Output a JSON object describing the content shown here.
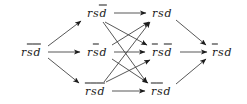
{
  "figure": {
    "type": "directed-graph",
    "background_color": "#ffffff",
    "ink_color": "#1b1b1b",
    "width": 247,
    "height": 104
  },
  "nodes": [
    {
      "id": "n0",
      "text": "rs̄d̄",
      "literals": [
        {
          "sym": "r",
          "bar": false
        },
        {
          "sym": "s",
          "bar": true
        },
        {
          "sym": "d",
          "bar": true
        }
      ],
      "x": 31,
      "y": 52,
      "column": 0,
      "row": "middle"
    },
    {
      "id": "n1",
      "text": "rsd̄",
      "literals": [
        {
          "sym": "r",
          "bar": false
        },
        {
          "sym": "s",
          "bar": false
        },
        {
          "sym": "d",
          "bar": true
        }
      ],
      "x": 97,
      "y": 13,
      "column": 1,
      "row": "top"
    },
    {
      "id": "n2",
      "text": "rs̄d",
      "literals": [
        {
          "sym": "r",
          "bar": false
        },
        {
          "sym": "s",
          "bar": true
        },
        {
          "sym": "d",
          "bar": false
        }
      ],
      "x": 97,
      "y": 52,
      "column": 1,
      "row": "middle"
    },
    {
      "id": "n3",
      "text": "r̄s̄d̄",
      "literals": [
        {
          "sym": "r",
          "bar": true
        },
        {
          "sym": "s",
          "bar": true
        },
        {
          "sym": "d",
          "bar": true
        }
      ],
      "x": 95,
      "y": 91,
      "column": 1,
      "row": "bottom"
    },
    {
      "id": "n4",
      "text": "rsd",
      "literals": [
        {
          "sym": "r",
          "bar": false
        },
        {
          "sym": "s",
          "bar": false
        },
        {
          "sym": "d",
          "bar": false
        }
      ],
      "x": 162,
      "y": 13,
      "column": 2,
      "row": "top"
    },
    {
      "id": "n5",
      "text": "r̄sd̄",
      "literals": [
        {
          "sym": "r",
          "bar": true
        },
        {
          "sym": "s",
          "bar": false
        },
        {
          "sym": "d",
          "bar": true
        }
      ],
      "x": 162,
      "y": 52,
      "column": 2,
      "row": "middle"
    },
    {
      "id": "n6",
      "text": "r̄s̄d",
      "literals": [
        {
          "sym": "r",
          "bar": true
        },
        {
          "sym": "s",
          "bar": true
        },
        {
          "sym": "d",
          "bar": false
        }
      ],
      "x": 161,
      "y": 91,
      "column": 2,
      "row": "bottom"
    },
    {
      "id": "n7",
      "text": "r̄sd",
      "literals": [
        {
          "sym": "r",
          "bar": true
        },
        {
          "sym": "s",
          "bar": false
        },
        {
          "sym": "d",
          "bar": false
        }
      ],
      "x": 222,
      "y": 52,
      "column": 3,
      "row": "middle"
    }
  ],
  "edges": [
    {
      "from": "n0",
      "to": "n1",
      "x1": 48,
      "y1": 46,
      "x2": 81,
      "y2": 21
    },
    {
      "from": "n0",
      "to": "n2",
      "x1": 48,
      "y1": 52,
      "x2": 80,
      "y2": 52
    },
    {
      "from": "n0",
      "to": "n3",
      "x1": 48,
      "y1": 58,
      "x2": 79,
      "y2": 83
    },
    {
      "from": "n1",
      "to": "n4",
      "x1": 114,
      "y1": 13,
      "x2": 146,
      "y2": 13
    },
    {
      "from": "n1",
      "to": "n5",
      "x1": 105,
      "y1": 22,
      "x2": 147,
      "y2": 45
    },
    {
      "from": "n1",
      "to": "n6",
      "x1": 103,
      "y1": 22,
      "x2": 147,
      "y2": 83
    },
    {
      "from": "n2",
      "to": "n4",
      "x1": 112,
      "y1": 45,
      "x2": 149,
      "y2": 22
    },
    {
      "from": "n2",
      "to": "n5",
      "x1": 114,
      "y1": 52,
      "x2": 145,
      "y2": 52
    },
    {
      "from": "n2",
      "to": "n6",
      "x1": 112,
      "y1": 59,
      "x2": 148,
      "y2": 83
    },
    {
      "from": "n3",
      "to": "n4",
      "x1": 104,
      "y1": 82,
      "x2": 150,
      "y2": 22
    },
    {
      "from": "n3",
      "to": "n5",
      "x1": 106,
      "y1": 82,
      "x2": 150,
      "y2": 60
    },
    {
      "from": "n3",
      "to": "n6",
      "x1": 112,
      "y1": 91,
      "x2": 145,
      "y2": 91
    },
    {
      "from": "n4",
      "to": "n7",
      "x1": 176,
      "y1": 20,
      "x2": 206,
      "y2": 45
    },
    {
      "from": "n5",
      "to": "n7",
      "x1": 180,
      "y1": 52,
      "x2": 207,
      "y2": 52
    },
    {
      "from": "n6",
      "to": "n7",
      "x1": 176,
      "y1": 84,
      "x2": 206,
      "y2": 59
    }
  ]
}
